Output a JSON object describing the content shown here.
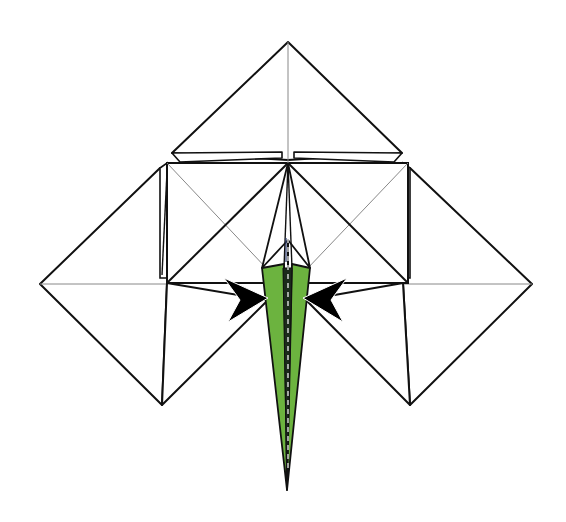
{
  "diagram": {
    "colors": {
      "background": "#ffffff",
      "line": "#111111",
      "crease": "#888888",
      "paper": "#ffffff",
      "stem_fill": "#6cb33f",
      "arrow_fill": "#000000",
      "dash_line": "#2a3a6a"
    },
    "shapes": {
      "top_kite": "top-flap",
      "left_square": "left-square-flap",
      "right_square": "right-square-flap",
      "left_side_kite": "left-side-point",
      "right_side_kite": "right-side-point",
      "stem": "green-stem-point",
      "left_arrow": "push-arrow-right",
      "right_arrow": "push-arrow-left"
    },
    "instruction": "Push the sides in (inside-reverse / narrowing fold) as indicated by the arrows."
  }
}
